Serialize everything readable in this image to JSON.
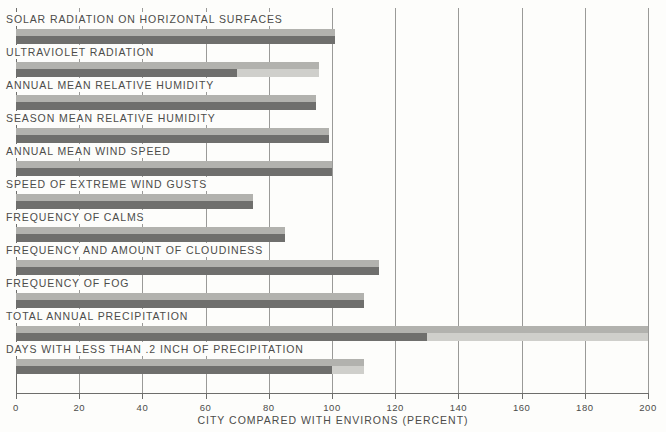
{
  "chart_data": {
    "type": "bar",
    "orientation": "horizontal",
    "title": "",
    "xlabel": "CITY COMPARED WITH ENVIRONS (PERCENT)",
    "ylabel": "",
    "xlim": [
      0,
      200
    ],
    "xticks": [
      0,
      20,
      40,
      60,
      80,
      100,
      120,
      140,
      160,
      180,
      200
    ],
    "xticklabels": [
      "0",
      "20",
      "40",
      "60",
      "80",
      "100",
      "120",
      "140",
      "160",
      "180",
      "200"
    ],
    "grid": true,
    "reference_value": 100,
    "categories": [
      "SOLAR RADIATION ON HORIZONTAL SURFACES",
      "ULTRAVIOLET RADIATION",
      "ANNUAL MEAN RELATIVE HUMIDITY",
      "SEASON MEAN RELATIVE HUMIDITY",
      "ANNUAL MEAN WIND SPEED",
      "SPEED OF EXTREME WIND GUSTS",
      "FREQUENCY OF CALMS",
      "FREQUENCY AND AMOUNT OF CLOUDINESS",
      "FREQUENCY OF FOG",
      "TOTAL ANNUAL PRECIPITATION",
      "DAYS WITH LESS THAN .2 INCH OF PRECIPITATION"
    ],
    "values": [
      101,
      70,
      95,
      99,
      100,
      75,
      85,
      115,
      110,
      130,
      100
    ],
    "upper_values": [
      101,
      96,
      95,
      99,
      100,
      75,
      85,
      115,
      110,
      200,
      110
    ],
    "series": [
      {
        "name": "lower bound",
        "values": [
          101,
          70,
          95,
          99,
          100,
          75,
          85,
          115,
          110,
          130,
          100
        ]
      },
      {
        "name": "upper bound",
        "values": [
          101,
          96,
          95,
          99,
          100,
          75,
          85,
          115,
          110,
          200,
          110
        ]
      }
    ],
    "colors": {
      "bar_dark": "#6f6f6d",
      "bar_light": "#b2b2ae",
      "bar_extension": "#cfcfcb",
      "axis": "#6d6d6b",
      "text": "#4c4c4a",
      "background": "#fdfdfb"
    }
  },
  "axis": {
    "title": "CITY COMPARED WITH ENVIRONS (PERCENT)"
  }
}
